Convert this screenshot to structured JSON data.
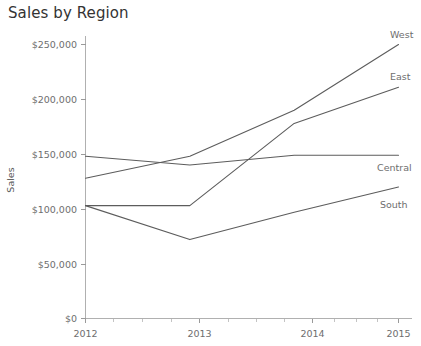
{
  "chart_data": {
    "type": "line",
    "title": "Sales by Region",
    "xlabel": "",
    "ylabel": "Sales",
    "categories": [
      "2012",
      "2013",
      "2014",
      "2015"
    ],
    "x": [
      2012,
      2013,
      2014,
      2015
    ],
    "xlim": [
      2012,
      2015
    ],
    "ylim": [
      0,
      250000
    ],
    "yticks": [
      0,
      50000,
      100000,
      150000,
      200000,
      250000
    ],
    "ytick_labels": [
      "$0",
      "$50,000",
      "$100,000",
      "$150,000",
      "$200,000",
      "$250,000"
    ],
    "xtick_labels": [
      "2012",
      "2013",
      "2014",
      "2015"
    ],
    "grid": false,
    "legend_position": "line-end-labels",
    "line_color": "#5c5c5c",
    "series": [
      {
        "name": "West",
        "values": [
          128000,
          148000,
          190000,
          250000
        ]
      },
      {
        "name": "East",
        "values": [
          103000,
          103000,
          178000,
          211000
        ]
      },
      {
        "name": "Central",
        "values": [
          148000,
          140000,
          149000,
          149000
        ]
      },
      {
        "name": "South",
        "values": [
          103000,
          72000,
          97000,
          120000
        ]
      }
    ]
  },
  "chart": {
    "title": "Sales by Region",
    "y_axis_title": "Sales"
  },
  "axis": {
    "y_labels": [
      "$250,000",
      "$200,000",
      "$150,000",
      "$100,000",
      "$50,000",
      "$0"
    ],
    "x_labels": [
      "2012",
      "2013",
      "2014",
      "2015"
    ]
  },
  "series_labels": {
    "west": "West",
    "east": "East",
    "central": "Central",
    "south": "South"
  }
}
